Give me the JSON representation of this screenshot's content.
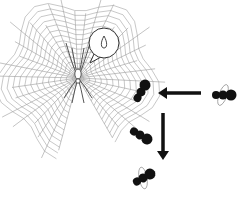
{
  "illustration": {
    "subject": "spider-web-with-spider-and-insects",
    "colors": {
      "background": "#ffffff",
      "web": "#9a9a9a",
      "spider": "#555555",
      "insect": "#111111",
      "arrow": "#111111",
      "wing": "#999999"
    },
    "web": {
      "center": [
        78,
        78
      ],
      "radius": 88,
      "spokes": 34,
      "rings": 14,
      "start_deg": 105,
      "end_deg": 420
    },
    "spider": {
      "x": 78,
      "y": 78
    },
    "speech_bubble": {
      "x": 104,
      "y": 43,
      "r": 15,
      "content_icon": "droplet-icon"
    },
    "insects": [
      {
        "name": "insect-flying-right",
        "x": 223,
        "y": 95,
        "angle": 0,
        "winged": true
      },
      {
        "name": "insect-caught-upper",
        "x": 141,
        "y": 92,
        "angle": -60,
        "winged": false
      },
      {
        "name": "insect-caught-middle",
        "x": 140,
        "y": 135,
        "angle": 30,
        "winged": false
      },
      {
        "name": "insect-caught-lower",
        "x": 143,
        "y": 178,
        "angle": -30,
        "winged": true
      }
    ],
    "arrows": [
      {
        "name": "arrow-left",
        "from": [
          201,
          93
        ],
        "to": [
          158,
          93
        ]
      },
      {
        "name": "arrow-down",
        "from": [
          163,
          113
        ],
        "to": [
          163,
          160
        ]
      }
    ]
  }
}
